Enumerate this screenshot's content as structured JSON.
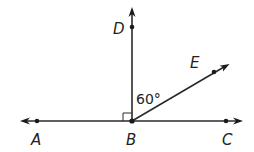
{
  "diagram": {
    "type": "geometry-angle-figure",
    "points": {
      "A": {
        "label": "A"
      },
      "B": {
        "label": "B"
      },
      "C": {
        "label": "C"
      },
      "D": {
        "label": "D"
      },
      "E": {
        "label": "E"
      }
    },
    "lines": [
      {
        "name": "line-AC",
        "through": [
          "A",
          "B",
          "C"
        ],
        "arrows": "both"
      }
    ],
    "rays": [
      {
        "name": "ray-BD",
        "from": "B",
        "through": "D"
      },
      {
        "name": "ray-BE",
        "from": "B",
        "through": "E"
      }
    ],
    "angle_marks": [
      {
        "name": "angle-ABD",
        "vertex": "B",
        "kind": "right-angle"
      },
      {
        "name": "angle-DBE",
        "vertex": "B",
        "label": "60°",
        "degrees": 60
      }
    ],
    "color": "#222222"
  }
}
